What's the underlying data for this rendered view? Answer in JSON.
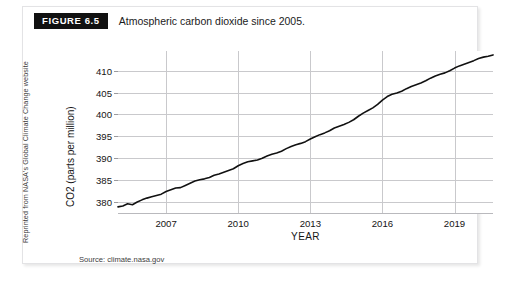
{
  "figure": {
    "badge_label": "FIGURE 6.5",
    "caption": "Atmospheric carbon dioxide since 2005.",
    "credit": "Reprinted from NASA's Global Climate Change website",
    "source_note": "Source: climate.nasa.gov"
  },
  "colors": {
    "badge_background": "#111111",
    "badge_text": "#ffffff",
    "line": "#111111",
    "grid": "#c9c9cc",
    "frame_border": "#e3e3e5",
    "page_background": "#ffffff"
  },
  "chart_data": {
    "type": "line",
    "title": "Atmospheric carbon dioxide since 2005.",
    "xlabel": "YEAR",
    "ylabel": "CO2 (parts per million)",
    "xlim": [
      2005.0,
      2020.6
    ],
    "ylim": [
      377.5,
      414.5
    ],
    "xticks": [
      2007,
      2010,
      2013,
      2016,
      2019
    ],
    "yticks": [
      380,
      385,
      390,
      395,
      400,
      405,
      410
    ],
    "grid": true,
    "legend": false,
    "series": [
      {
        "name": "CO2 (ppm)",
        "x": [
          2005.0,
          2005.2,
          2005.4,
          2005.6,
          2005.8,
          2006.0,
          2006.2,
          2006.4,
          2006.6,
          2006.8,
          2007.0,
          2007.2,
          2007.4,
          2007.6,
          2007.8,
          2008.0,
          2008.2,
          2008.4,
          2008.6,
          2008.8,
          2009.0,
          2009.2,
          2009.4,
          2009.6,
          2009.8,
          2010.0,
          2010.2,
          2010.4,
          2010.6,
          2010.8,
          2011.0,
          2011.2,
          2011.4,
          2011.6,
          2011.8,
          2012.0,
          2012.2,
          2012.4,
          2012.6,
          2012.8,
          2013.0,
          2013.2,
          2013.4,
          2013.6,
          2013.8,
          2014.0,
          2014.2,
          2014.4,
          2014.6,
          2014.8,
          2015.0,
          2015.2,
          2015.4,
          2015.6,
          2015.8,
          2016.0,
          2016.2,
          2016.4,
          2016.6,
          2016.8,
          2017.0,
          2017.2,
          2017.4,
          2017.6,
          2017.8,
          2018.0,
          2018.2,
          2018.4,
          2018.6,
          2018.8,
          2019.0,
          2019.2,
          2019.4,
          2019.6,
          2019.8,
          2020.0,
          2020.2,
          2020.4,
          2020.6
        ],
        "values": [
          378.9,
          379.1,
          379.6,
          379.4,
          380.0,
          380.5,
          380.9,
          381.2,
          381.5,
          381.8,
          382.4,
          382.8,
          383.2,
          383.3,
          383.8,
          384.3,
          384.8,
          385.1,
          385.3,
          385.6,
          386.1,
          386.4,
          386.8,
          387.2,
          387.6,
          388.3,
          388.8,
          389.2,
          389.4,
          389.6,
          390.0,
          390.5,
          390.9,
          391.2,
          391.6,
          392.2,
          392.7,
          393.1,
          393.4,
          393.8,
          394.4,
          394.9,
          395.4,
          395.8,
          396.3,
          396.9,
          397.3,
          397.7,
          398.2,
          398.8,
          399.6,
          400.3,
          400.9,
          401.5,
          402.3,
          403.3,
          404.1,
          404.6,
          404.9,
          405.3,
          405.9,
          406.4,
          406.8,
          407.2,
          407.7,
          408.3,
          408.8,
          409.2,
          409.5,
          410.0,
          410.6,
          411.1,
          411.5,
          411.9,
          412.3,
          412.8,
          413.1,
          413.3,
          413.6
        ]
      }
    ]
  }
}
